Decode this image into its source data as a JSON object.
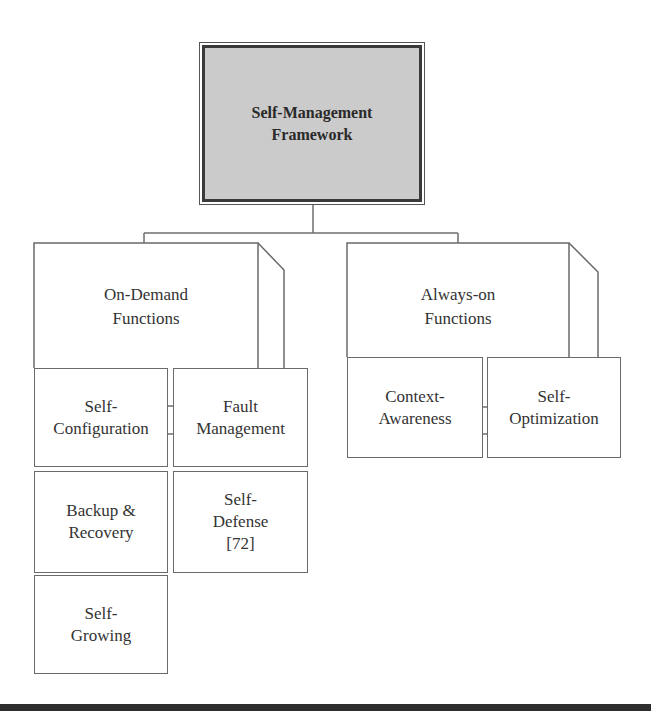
{
  "diagram": {
    "title": "Self-Management\nFramework",
    "groups": [
      {
        "label": "On-Demand\nFunctions",
        "children": [
          {
            "label": "Self-\nConfiguration"
          },
          {
            "label": "Fault\nManagement"
          },
          {
            "label": "Backup &\nRecovery"
          },
          {
            "label": "Self-\nDefense\n[72]"
          },
          {
            "label": "Self-\nGrowing"
          }
        ]
      },
      {
        "label": "Always-on\nFunctions",
        "children": [
          {
            "label": "Context-\nAwareness"
          },
          {
            "label": "Self-\nOptimization"
          }
        ]
      }
    ],
    "colors": {
      "root_fill": "#cbcbcb",
      "root_border": "#3a3a3a",
      "line": "#6e6e6e",
      "bottom_rule": "#2e2e2e"
    }
  }
}
